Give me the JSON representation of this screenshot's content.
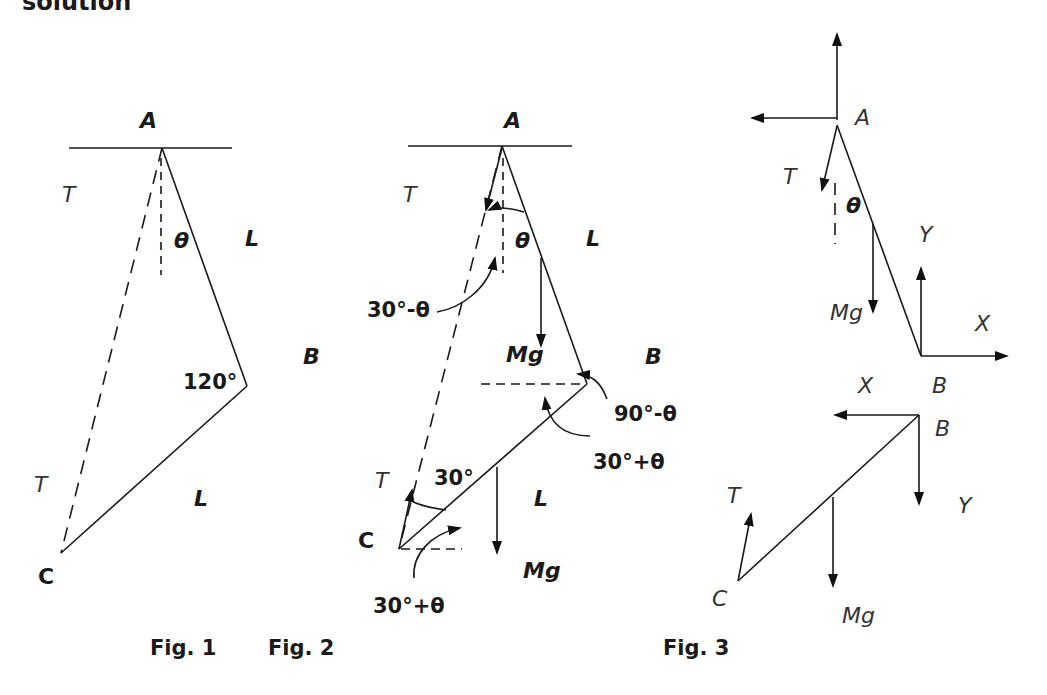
{
  "heading": "solution",
  "figures": [
    {
      "caption": "Fig. 1",
      "labels": {
        "A": "A",
        "T_top": "T",
        "theta": "θ",
        "L_top": "L",
        "B": "B",
        "angle_B": "120°",
        "T_bottom": "T",
        "L_bottom": "L",
        "C": "C"
      }
    },
    {
      "caption": "Fig. 2",
      "labels": {
        "A": "A",
        "T_top": "T",
        "theta": "θ",
        "L_top": "L",
        "angle_a": "30°-θ",
        "Mg_top": "Mg",
        "B": "B",
        "angle_b1": "90°-θ",
        "angle_b2": "30°+θ",
        "T_bottom": "T",
        "angle_c": "30°",
        "L_bottom": "L",
        "C": "C",
        "Mg_bottom": "Mg",
        "angle_c2": "30°+θ"
      }
    },
    {
      "caption": "Fig. 3",
      "labels": {
        "A": "A",
        "T_top": "T",
        "theta": "θ",
        "Y_top": "Y",
        "Mg_top": "Mg",
        "X_top": "X",
        "X_bottom": "X",
        "B_top": "B",
        "B_bottom": "B",
        "T_bottom": "T",
        "Y_bottom": "Y",
        "C": "C",
        "Mg_bottom": "Mg"
      }
    }
  ]
}
